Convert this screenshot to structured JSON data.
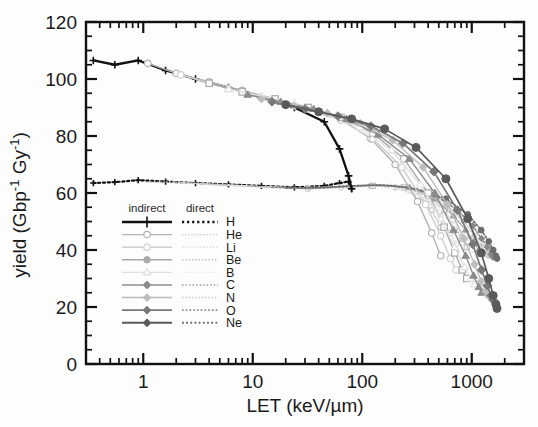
{
  "chart_data": {
    "type": "line",
    "title": "",
    "xlabel": "LET (keV/µm)",
    "ylabel": "yield (Gbp⁻¹ Gy⁻¹)",
    "xscale": "log",
    "yscale": "linear",
    "xlim": [
      0.3,
      3000
    ],
    "ylim": [
      0,
      120
    ],
    "xticks": [
      1,
      10,
      100,
      1000
    ],
    "xtick_labels": [
      "1",
      "10",
      "100",
      "1000"
    ],
    "yticks": [
      0,
      20,
      40,
      60,
      80,
      100,
      120
    ],
    "ytick_labels": [
      "0",
      "20",
      "40",
      "60",
      "80",
      "100",
      "120"
    ],
    "grid": false,
    "legend_position": "lower-left-inside",
    "legend_headers": [
      "indirect",
      "direct"
    ],
    "legend_entries": [
      "H",
      "He",
      "Li",
      "Be",
      "B",
      "C",
      "N",
      "O",
      "Ne"
    ],
    "series": [
      {
        "name": "H",
        "damage_type": "indirect",
        "linestyle": "solid",
        "marker": "plus",
        "color": "#111111",
        "x": [
          0.35,
          0.55,
          0.9,
          1.6,
          3.0,
          6.0,
          12.0,
          24.0,
          45.0,
          62.0,
          75.0,
          80.0
        ],
        "y": [
          106.5,
          105.0,
          106.5,
          103.0,
          100.0,
          97.0,
          93.5,
          90.0,
          85.0,
          75.5,
          66.0,
          61.5
        ]
      },
      {
        "name": "H",
        "damage_type": "direct",
        "linestyle": "dotted",
        "marker": "plus",
        "color": "#111111",
        "x": [
          0.35,
          0.55,
          0.9,
          1.6,
          3.0,
          6.0,
          12.0,
          24.0,
          45.0,
          62.0,
          75.0,
          80.0
        ],
        "y": [
          63.5,
          63.8,
          64.5,
          64.0,
          63.5,
          63.0,
          62.5,
          62.0,
          62.5,
          63.5,
          64.0,
          61.5
        ]
      },
      {
        "name": "He",
        "damage_type": "indirect",
        "linestyle": "solid",
        "marker": "circle-open",
        "color": "#b4b4b4",
        "x": [
          1.1,
          2.0,
          4.0,
          8.0,
          16.0,
          32.0,
          64.0,
          120.0,
          200.0,
          320.0,
          430.0,
          520.0
        ],
        "y": [
          105.5,
          102.0,
          99.0,
          96.0,
          93.0,
          90.0,
          86.0,
          79.0,
          70.0,
          57.0,
          46.0,
          38.0
        ]
      },
      {
        "name": "He",
        "damage_type": "direct",
        "linestyle": "dotted",
        "marker": "circle-open",
        "color": "#c8c8c8",
        "x": [
          1.1,
          2.0,
          4.0,
          8.0,
          16.0,
          32.0,
          64.0,
          120.0,
          200.0,
          320.0,
          430.0,
          520.0
        ],
        "y": [
          63.8,
          63.8,
          63.2,
          62.5,
          62.0,
          61.5,
          62.0,
          62.5,
          62.0,
          59.0,
          54.0,
          48.0
        ]
      },
      {
        "name": "Li",
        "damage_type": "indirect",
        "linestyle": "solid",
        "marker": "circle-open",
        "color": "#cfcfcf",
        "x": [
          2.2,
          4.0,
          8.0,
          16.0,
          32.0,
          64.0,
          125.0,
          230.0,
          380.0,
          520.0,
          640.0,
          720.0
        ],
        "y": [
          101.5,
          98.5,
          95.5,
          92.5,
          89.5,
          85.5,
          79.0,
          69.0,
          56.0,
          45.0,
          37.0,
          33.0
        ]
      },
      {
        "name": "Li",
        "damage_type": "direct",
        "linestyle": "dotted",
        "marker": "circle-open",
        "color": "#dcdcdc",
        "x": [
          2.2,
          4.0,
          8.0,
          16.0,
          32.0,
          64.0,
          125.0,
          230.0,
          380.0,
          520.0,
          640.0,
          720.0
        ],
        "y": [
          63.5,
          63.0,
          62.5,
          62.0,
          61.5,
          62.0,
          62.5,
          62.0,
          58.0,
          52.0,
          46.0,
          42.0
        ]
      },
      {
        "name": "Be",
        "damage_type": "indirect",
        "linestyle": "solid",
        "marker": "square-open",
        "color": "#a9a9a9",
        "x": [
          4.0,
          8.0,
          16.0,
          32.0,
          64.0,
          125.0,
          240.0,
          400.0,
          560.0,
          700.0,
          820.0,
          900.0
        ],
        "y": [
          98.5,
          95.5,
          93.0,
          90.0,
          86.5,
          81.0,
          72.0,
          60.0,
          48.0,
          39.0,
          33.0,
          30.0
        ]
      },
      {
        "name": "Be",
        "damage_type": "direct",
        "linestyle": "dotted",
        "marker": "square-open",
        "color": "#c0c0c0",
        "x": [
          4.0,
          8.0,
          16.0,
          32.0,
          64.0,
          125.0,
          240.0,
          400.0,
          560.0,
          700.0,
          820.0,
          900.0
        ],
        "y": [
          63.0,
          62.5,
          62.0,
          61.5,
          62.0,
          62.5,
          62.0,
          59.0,
          54.0,
          48.0,
          44.0,
          41.0
        ]
      },
      {
        "name": "B",
        "damage_type": "indirect",
        "linestyle": "solid",
        "marker": "triangle-open",
        "color": "#e0e0e0",
        "x": [
          6.0,
          12.0,
          24.0,
          48.0,
          95.0,
          185.0,
          340.0,
          520.0,
          700.0,
          860.0,
          980.0,
          1060.0
        ],
        "y": [
          96.5,
          94.0,
          91.5,
          88.0,
          83.0,
          75.0,
          63.0,
          51.0,
          41.0,
          34.0,
          30.0,
          28.0
        ]
      },
      {
        "name": "B",
        "damage_type": "direct",
        "linestyle": "dotted",
        "marker": "triangle-open",
        "color": "#e8e8e8",
        "x": [
          6.0,
          12.0,
          24.0,
          48.0,
          95.0,
          185.0,
          340.0,
          520.0,
          700.0,
          860.0,
          980.0,
          1060.0
        ],
        "y": [
          62.8,
          62.2,
          61.8,
          62.0,
          62.5,
          62.2,
          59.0,
          54.5,
          49.0,
          45.0,
          42.0,
          40.0
        ]
      },
      {
        "name": "C",
        "damage_type": "indirect",
        "linestyle": "solid",
        "marker": "triangle-filled",
        "color": "#8c8c8c",
        "x": [
          9.0,
          18.0,
          36.0,
          72.0,
          140.0,
          270.0,
          460.0,
          680.0,
          880.0,
          1040.0,
          1160.0,
          1230.0
        ],
        "y": [
          94.5,
          92.0,
          89.5,
          86.0,
          80.5,
          72.0,
          60.0,
          47.0,
          38.0,
          31.0,
          27.0,
          25.0
        ]
      },
      {
        "name": "C",
        "damage_type": "direct",
        "linestyle": "dotted",
        "marker": "triangle-filled",
        "color": "#9a9a9a",
        "x": [
          9.0,
          18.0,
          36.0,
          72.0,
          140.0,
          270.0,
          460.0,
          680.0,
          880.0,
          1040.0,
          1160.0,
          1230.0
        ],
        "y": [
          62.5,
          62.0,
          61.8,
          62.2,
          62.8,
          62.0,
          58.0,
          52.0,
          47.0,
          43.0,
          40.0,
          38.5
        ]
      },
      {
        "name": "N",
        "damage_type": "indirect",
        "linestyle": "solid",
        "marker": "diamond-filled",
        "color": "#bdbdbd",
        "x": [
          12.0,
          24.0,
          48.0,
          96.0,
          190.0,
          360.0,
          600.0,
          850.0,
          1060.0,
          1220.0,
          1340.0,
          1410.0
        ],
        "y": [
          93.0,
          90.5,
          88.0,
          84.5,
          78.5,
          69.0,
          56.0,
          44.0,
          35.0,
          29.0,
          25.5,
          24.0
        ]
      },
      {
        "name": "N",
        "damage_type": "direct",
        "linestyle": "dotted",
        "marker": "diamond-filled",
        "color": "#cacaca",
        "x": [
          12.0,
          24.0,
          48.0,
          96.0,
          190.0,
          360.0,
          600.0,
          850.0,
          1060.0,
          1220.0,
          1340.0,
          1410.0
        ],
        "y": [
          62.2,
          61.8,
          62.0,
          62.5,
          62.5,
          60.5,
          55.5,
          50.0,
          45.0,
          41.5,
          39.0,
          38.0
        ]
      },
      {
        "name": "O",
        "damage_type": "indirect",
        "linestyle": "solid",
        "marker": "diamond-filled",
        "color": "#787878",
        "x": [
          15.0,
          30.0,
          60.0,
          120.0,
          235.0,
          450.0,
          740.0,
          1020.0,
          1230.0,
          1390.0,
          1500.0,
          1560.0
        ],
        "y": [
          92.0,
          89.5,
          87.0,
          83.5,
          77.5,
          67.5,
          54.0,
          42.0,
          33.0,
          27.5,
          24.0,
          22.5
        ]
      },
      {
        "name": "O",
        "damage_type": "direct",
        "linestyle": "dotted",
        "marker": "diamond-filled",
        "color": "#888888",
        "x": [
          15.0,
          30.0,
          60.0,
          120.0,
          235.0,
          450.0,
          740.0,
          1020.0,
          1230.0,
          1390.0,
          1500.0,
          1560.0
        ],
        "y": [
          62.0,
          61.8,
          62.2,
          62.8,
          62.2,
          59.5,
          54.0,
          48.5,
          44.0,
          41.0,
          38.5,
          37.5
        ]
      },
      {
        "name": "Ne",
        "damage_type": "indirect",
        "linestyle": "solid",
        "marker": "circle-filled",
        "color": "#5a5a5a",
        "x": [
          20.0,
          40.0,
          80.0,
          160.0,
          310.0,
          580.0,
          920.0,
          1220.0,
          1430.0,
          1570.0,
          1660.0,
          1700.0
        ],
        "y": [
          91.0,
          88.5,
          86.0,
          82.5,
          76.0,
          65.0,
          51.0,
          39.0,
          30.0,
          24.0,
          21.0,
          19.5
        ]
      },
      {
        "name": "Ne",
        "damage_type": "direct",
        "linestyle": "dotted",
        "marker": "circle-filled",
        "color": "#6c6c6c",
        "x": [
          20.0,
          40.0,
          80.0,
          160.0,
          310.0,
          580.0,
          920.0,
          1220.0,
          1430.0,
          1570.0,
          1660.0,
          1700.0
        ],
        "y": [
          61.8,
          61.8,
          62.5,
          62.8,
          61.5,
          58.0,
          52.5,
          47.0,
          43.0,
          40.0,
          38.0,
          37.0
        ]
      }
    ]
  },
  "axes": {
    "xlabel": "LET (keV/µm)",
    "ylabel_main": "yield (Gbp",
    "ylabel_sup1": "-1",
    "ylabel_mid": " Gy",
    "ylabel_sup2": "-1",
    "ylabel_end": ")"
  },
  "legend": {
    "header_indirect": "indirect",
    "header_direct": "direct",
    "rows": [
      {
        "label": "H",
        "indirect_color": "#111111",
        "direct_color": "#111111",
        "marker": "plus",
        "width": 2.3
      },
      {
        "label": "He",
        "indirect_color": "#b4b4b4",
        "direct_color": "#c8c8c8",
        "marker": "circle-open",
        "width": 1.4
      },
      {
        "label": "Li",
        "indirect_color": "#cfcfcf",
        "direct_color": "#dcdcdc",
        "marker": "circle-open",
        "width": 1.4
      },
      {
        "label": "Be",
        "indirect_color": "#a9a9a9",
        "direct_color": "#c0c0c0",
        "marker": "circle-filled",
        "width": 1.5
      },
      {
        "label": "B",
        "indirect_color": "#e0e0e0",
        "direct_color": "#e8e8e8",
        "marker": "triangle-open",
        "width": 1.3
      },
      {
        "label": "C",
        "indirect_color": "#8c8c8c",
        "direct_color": "#9a9a9a",
        "marker": "diamond-filled",
        "width": 1.6
      },
      {
        "label": "N",
        "indirect_color": "#bdbdbd",
        "direct_color": "#cacaca",
        "marker": "diamond-filled",
        "width": 1.5
      },
      {
        "label": "O",
        "indirect_color": "#787878",
        "direct_color": "#888888",
        "marker": "diamond-filled",
        "width": 1.7
      },
      {
        "label": "Ne",
        "indirect_color": "#5a5a5a",
        "direct_color": "#6c6c6c",
        "marker": "diamond-filled",
        "width": 1.9
      }
    ]
  },
  "colors": {
    "frame": "#111111",
    "background": "#fdfdfd",
    "text": "#1a1a1a"
  }
}
